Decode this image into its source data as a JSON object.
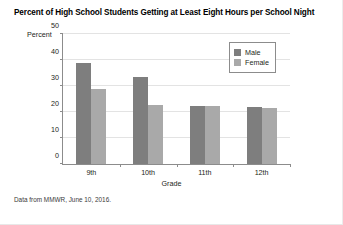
{
  "chart_data": {
    "type": "bar",
    "title": "Percent of High School Students Getting at Least Eight Hours per School Night",
    "xlabel": "Grade",
    "ylabel": "Percent",
    "categories": [
      "9th",
      "10th",
      "11th",
      "12th"
    ],
    "series": [
      {
        "name": "Male",
        "color": "#7e7e7e",
        "values": [
          39.0,
          33.5,
          22.5,
          22.0
        ]
      },
      {
        "name": "Female",
        "color": "#a9a9a9",
        "values": [
          29.0,
          22.7,
          22.3,
          21.5
        ]
      }
    ],
    "ylim": [
      0,
      50
    ],
    "yticks": [
      0,
      10,
      20,
      30,
      40,
      50
    ],
    "grid": true,
    "legend_position": "top-right",
    "source_note": "Data from MMWR, June 10, 2016."
  }
}
